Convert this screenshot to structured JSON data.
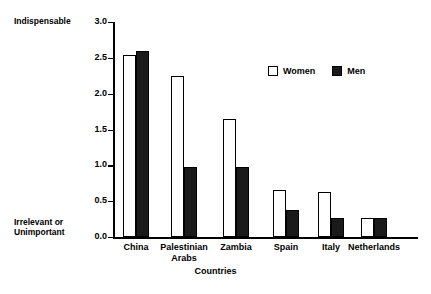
{
  "chart_data": {
    "type": "bar",
    "title": "",
    "xlabel": "Countries",
    "ylabel": "",
    "ylim": [
      0,
      3.0
    ],
    "ytick_values": [
      0.0,
      0.5,
      1.0,
      1.5,
      2.0,
      2.5,
      3.0
    ],
    "ytick_labels": [
      "0.0",
      "0.5",
      "1.0",
      "1.5",
      "2.0",
      "2.5",
      "3.0"
    ],
    "y_axis_top_anchor": "Indispensable",
    "y_axis_bottom_anchor": "Irrelevant or\nUnimportant",
    "grid": false,
    "legend_position": "upper right inside",
    "categories": [
      "China",
      "Palestinian\nArabs",
      "Zambia",
      "Spain",
      "Italy",
      "Netherlands"
    ],
    "series": [
      {
        "name": "Women",
        "color": "#ffffff",
        "values": [
          2.54,
          2.25,
          1.65,
          0.65,
          0.63,
          0.27
        ]
      },
      {
        "name": "Men",
        "color": "#1a1a1a",
        "values": [
          2.6,
          0.97,
          0.97,
          0.38,
          0.27,
          0.27
        ]
      }
    ]
  },
  "legend": {
    "items": [
      {
        "label": "Women",
        "swatch": "hollow-square-icon"
      },
      {
        "label": "Men",
        "swatch": "filled-square-icon"
      }
    ]
  }
}
